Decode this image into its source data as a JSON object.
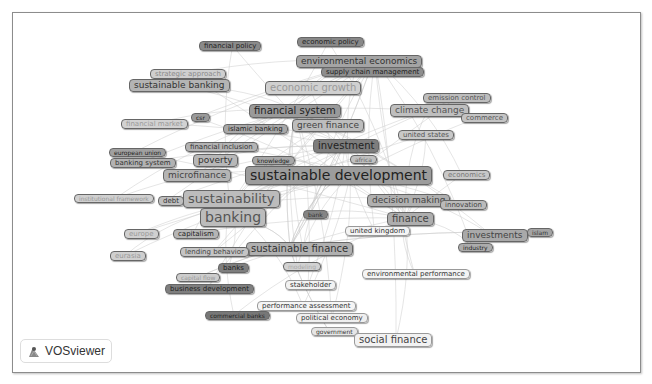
{
  "app": {
    "name": "VOSviewer",
    "logo_label": "VOSviewer"
  },
  "map": {
    "nodes": [
      {
        "id": "financial-policy",
        "label": "financial policy",
        "x": 199,
        "y": 41,
        "fs": 7,
        "bg": "#8a8a8a",
        "fg": "#222"
      },
      {
        "id": "economic-policy",
        "label": "economic policy",
        "x": 297,
        "y": 37,
        "fs": 7,
        "bg": "#888",
        "fg": "#222"
      },
      {
        "id": "environmental-economics",
        "label": "environmental economics",
        "x": 296,
        "y": 55,
        "fs": 9,
        "bg": "#a4a4a4",
        "fg": "#333"
      },
      {
        "id": "supply-chain-management",
        "label": "supply chain management",
        "x": 321,
        "y": 67,
        "fs": 7,
        "bg": "#8e8e8e",
        "fg": "#222"
      },
      {
        "id": "strategic-approach",
        "label": "strategic approach",
        "x": 150,
        "y": 69,
        "fs": 7,
        "bg": "#cfcfcf",
        "fg": "#8a8a8a"
      },
      {
        "id": "sustainable-banking",
        "label": "sustainable banking",
        "x": 129,
        "y": 79,
        "fs": 9,
        "bg": "#b4b4b4",
        "fg": "#333"
      },
      {
        "id": "economic-growth",
        "label": "economic growth",
        "x": 265,
        "y": 81,
        "fs": 10,
        "bg": "#d0d0d0",
        "fg": "#9a9a9a"
      },
      {
        "id": "emission-control",
        "label": "emission control",
        "x": 423,
        "y": 93,
        "fs": 7,
        "bg": "#bdbdbd",
        "fg": "#555"
      },
      {
        "id": "climate-change",
        "label": "climate change",
        "x": 390,
        "y": 104,
        "fs": 9,
        "bg": "#bfbfbf",
        "fg": "#555"
      },
      {
        "id": "commerce",
        "label": "commerce",
        "x": 461,
        "y": 113,
        "fs": 7,
        "bg": "#c4c4c4",
        "fg": "#555"
      },
      {
        "id": "financial-system",
        "label": "financial system",
        "x": 249,
        "y": 104,
        "fs": 10,
        "bg": "#9a9a9a",
        "fg": "#222"
      },
      {
        "id": "csr",
        "label": "csr",
        "x": 191,
        "y": 113,
        "fs": 6,
        "bg": "#9a9a9a",
        "fg": "#222"
      },
      {
        "id": "financial-market",
        "label": "financial market",
        "x": 121,
        "y": 119,
        "fs": 7,
        "bg": "#d2d2d2",
        "fg": "#999"
      },
      {
        "id": "islamic-banking",
        "label": "islamic banking",
        "x": 223,
        "y": 124,
        "fs": 7,
        "bg": "#a8a8a8",
        "fg": "#222"
      },
      {
        "id": "green-finance",
        "label": "green finance",
        "x": 292,
        "y": 119,
        "fs": 9,
        "bg": "#bdbdbd",
        "fg": "#444"
      },
      {
        "id": "united-states",
        "label": "united states",
        "x": 398,
        "y": 130,
        "fs": 7,
        "bg": "#c8c8c8",
        "fg": "#555"
      },
      {
        "id": "financial-inclusion",
        "label": "financial inclusion",
        "x": 185,
        "y": 142,
        "fs": 7,
        "bg": "#b4b4b4",
        "fg": "#333"
      },
      {
        "id": "investment",
        "label": "investment",
        "x": 313,
        "y": 139,
        "fs": 10,
        "bg": "#7d7d7d",
        "fg": "#222"
      },
      {
        "id": "european-union",
        "label": "european union",
        "x": 109,
        "y": 148,
        "fs": 6,
        "bg": "#a0a0a0",
        "fg": "#222"
      },
      {
        "id": "banking-system",
        "label": "banking system",
        "x": 110,
        "y": 158,
        "fs": 7,
        "bg": "#b2b2b2",
        "fg": "#333"
      },
      {
        "id": "poverty",
        "label": "poverty",
        "x": 193,
        "y": 154,
        "fs": 9,
        "bg": "#b8b8b8",
        "fg": "#333"
      },
      {
        "id": "knowledge",
        "label": "knowledge",
        "x": 252,
        "y": 156,
        "fs": 6,
        "bg": "#a8a8a8",
        "fg": "#222"
      },
      {
        "id": "africa",
        "label": "africa",
        "x": 350,
        "y": 155,
        "fs": 6,
        "bg": "#c0c0c0",
        "fg": "#666"
      },
      {
        "id": "microfinance",
        "label": "microfinance",
        "x": 163,
        "y": 169,
        "fs": 9,
        "bg": "#b5b5b5",
        "fg": "#444"
      },
      {
        "id": "sustainable-development",
        "label": "sustainable development",
        "x": 245,
        "y": 166,
        "fs": 14,
        "bg": "#9c9c9c",
        "fg": "#222"
      },
      {
        "id": "economics",
        "label": "economics",
        "x": 443,
        "y": 170,
        "fs": 7,
        "bg": "#c8c8c8",
        "fg": "#777"
      },
      {
        "id": "institutional-framework",
        "label": "institutional framework",
        "x": 74,
        "y": 194,
        "fs": 6,
        "bg": "#d0d0d0",
        "fg": "#999"
      },
      {
        "id": "debt",
        "label": "debt",
        "x": 158,
        "y": 196,
        "fs": 7,
        "bg": "#bfbfbf",
        "fg": "#333"
      },
      {
        "id": "sustainability",
        "label": "sustainability",
        "x": 183,
        "y": 190,
        "fs": 13,
        "bg": "#bcbcbc",
        "fg": "#555"
      },
      {
        "id": "decision-making",
        "label": "decision making",
        "x": 367,
        "y": 194,
        "fs": 9,
        "bg": "#b0b0b0",
        "fg": "#444"
      },
      {
        "id": "innovation",
        "label": "innovation",
        "x": 440,
        "y": 200,
        "fs": 7,
        "bg": "#bbbbbb",
        "fg": "#444"
      },
      {
        "id": "banking",
        "label": "banking",
        "x": 200,
        "y": 208,
        "fs": 14,
        "bg": "#bcbcbc",
        "fg": "#555"
      },
      {
        "id": "bank",
        "label": "bank",
        "x": 303,
        "y": 210,
        "fs": 6,
        "bg": "#848484",
        "fg": "#333"
      },
      {
        "id": "finance",
        "label": "finance",
        "x": 387,
        "y": 212,
        "fs": 10,
        "bg": "#aeaeae",
        "fg": "#444"
      },
      {
        "id": "united-kingdom",
        "label": "united kingdom",
        "x": 345,
        "y": 226,
        "fs": 7,
        "bg": "#f4f4f4",
        "fg": "#333",
        "border": "#999"
      },
      {
        "id": "europe",
        "label": "europe",
        "x": 124,
        "y": 229,
        "fs": 7,
        "bg": "#d0d0d0",
        "fg": "#999"
      },
      {
        "id": "capitalism",
        "label": "capitalism",
        "x": 173,
        "y": 229,
        "fs": 7,
        "bg": "#b5b5b5",
        "fg": "#222"
      },
      {
        "id": "investments",
        "label": "investments",
        "x": 462,
        "y": 229,
        "fs": 9,
        "bg": "#a9a9a9",
        "fg": "#444"
      },
      {
        "id": "islam",
        "label": "islam",
        "x": 527,
        "y": 228,
        "fs": 6,
        "bg": "#a4a4a4",
        "fg": "#333"
      },
      {
        "id": "industry",
        "label": "industry",
        "x": 458,
        "y": 243,
        "fs": 6,
        "bg": "#acacac",
        "fg": "#222"
      },
      {
        "id": "sustainable-finance",
        "label": "sustainable finance",
        "x": 246,
        "y": 242,
        "fs": 10,
        "bg": "#b0b0b0",
        "fg": "#333"
      },
      {
        "id": "lending-behavior",
        "label": "lending behavior",
        "x": 180,
        "y": 247,
        "fs": 7,
        "bg": "#c4c4c4",
        "fg": "#444"
      },
      {
        "id": "eurasia",
        "label": "eurasia",
        "x": 110,
        "y": 251,
        "fs": 7,
        "bg": "#cfcfcf",
        "fg": "#999"
      },
      {
        "id": "banks",
        "label": "banks",
        "x": 218,
        "y": 263,
        "fs": 7,
        "bg": "#7e7e7e",
        "fg": "#222"
      },
      {
        "id": "modeling",
        "label": "modeling",
        "x": 283,
        "y": 262,
        "fs": 6,
        "bg": "#d2d2d2",
        "fg": "#aaa"
      },
      {
        "id": "capital-flow",
        "label": "capital flow",
        "x": 176,
        "y": 273,
        "fs": 6,
        "bg": "#cdcdcd",
        "fg": "#999"
      },
      {
        "id": "environmental-performance",
        "label": "environmental performance",
        "x": 362,
        "y": 269,
        "fs": 7,
        "bg": "#f4f4f4",
        "fg": "#333",
        "border": "#999"
      },
      {
        "id": "stakeholder",
        "label": "stakeholder",
        "x": 285,
        "y": 280,
        "fs": 7,
        "bg": "#f2f2f2",
        "fg": "#333",
        "border": "#999"
      },
      {
        "id": "business-development",
        "label": "business development",
        "x": 165,
        "y": 284,
        "fs": 7,
        "bg": "#7f7f7f",
        "fg": "#222"
      },
      {
        "id": "performance-assessment",
        "label": "performance assessment",
        "x": 257,
        "y": 301,
        "fs": 7,
        "bg": "#f5f5f5",
        "fg": "#333",
        "border": "#999"
      },
      {
        "id": "commercial-banks",
        "label": "commercial banks",
        "x": 205,
        "y": 311,
        "fs": 6,
        "bg": "#777",
        "fg": "#222"
      },
      {
        "id": "political-economy",
        "label": "political economy",
        "x": 296,
        "y": 313,
        "fs": 7,
        "bg": "#efefef",
        "fg": "#333",
        "border": "#999"
      },
      {
        "id": "government",
        "label": "government",
        "x": 311,
        "y": 327,
        "fs": 6,
        "bg": "#e6e6e6",
        "fg": "#333",
        "border": "#999"
      },
      {
        "id": "social-finance",
        "label": "social finance",
        "x": 354,
        "y": 333,
        "fs": 10,
        "bg": "#f2f2f2",
        "fg": "#444",
        "border": "#999"
      }
    ],
    "hubs": [
      {
        "x": 350,
        "y": 176
      },
      {
        "x": 230,
        "y": 205
      },
      {
        "x": 295,
        "y": 110
      },
      {
        "x": 290,
        "y": 247
      },
      {
        "x": 405,
        "y": 218
      },
      {
        "x": 345,
        "y": 146
      },
      {
        "x": 375,
        "y": 60
      }
    ]
  }
}
